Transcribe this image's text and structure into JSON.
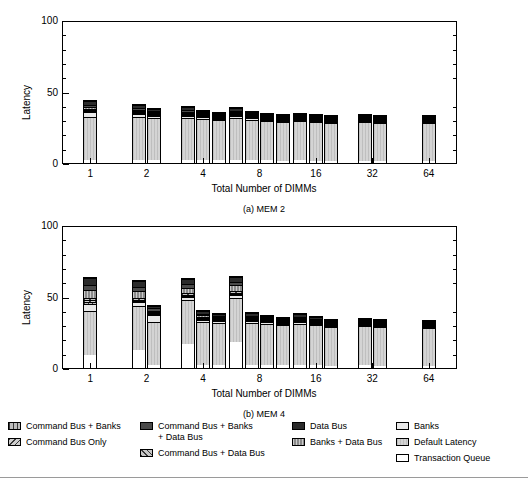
{
  "figure": {
    "panels": [
      {
        "id": "mem2",
        "caption": "(a) MEM 2",
        "xlabel": "Total Number of DIMMs",
        "ylabel": "Latency"
      },
      {
        "id": "mem4",
        "caption": "(b) MEM 4",
        "xlabel": "Total Number of DIMMs",
        "ylabel": "Latency"
      }
    ],
    "yticks": [
      "0",
      "50",
      "100"
    ],
    "xticks": [
      "1",
      "2",
      "4",
      "8",
      "16",
      "32",
      "64"
    ],
    "legend": {
      "col1": [
        {
          "key": "command-bus-banks",
          "label": "Command Bus + Banks",
          "fill": "f-cbb"
        },
        {
          "key": "command-bus-only",
          "label": "Command Bus Only",
          "fill": "f-cbo"
        }
      ],
      "col2": [
        {
          "key": "command-bus-banks-data-bus",
          "label": "Command Bus + Banks\n+ Data Bus",
          "fill": "f-cbbdb"
        },
        {
          "key": "command-bus-data-bus",
          "label": "Command Bus + Data Bus",
          "fill": "f-cbdb"
        }
      ],
      "col3": [
        {
          "key": "data-bus",
          "label": "Data Bus",
          "fill": "f-db"
        },
        {
          "key": "banks-data-bus",
          "label": "Banks + Data Bus",
          "fill": "f-bdb"
        }
      ],
      "col4": [
        {
          "key": "banks",
          "label": "Banks",
          "fill": "f-banks"
        },
        {
          "key": "default-latency",
          "label": "Default Latency",
          "fill": "f-def"
        },
        {
          "key": "transaction-queue",
          "label": "Transaction Queue",
          "fill": "f-tq"
        }
      ]
    }
  },
  "chart_data": [
    {
      "type": "bar",
      "subtype": "stacked-grouped",
      "title": "(a) MEM 2",
      "xlabel": "Total Number of DIMMs",
      "ylabel": "Latency",
      "ylim": [
        0,
        100
      ],
      "yticks": [
        0,
        50,
        100
      ],
      "grid": false,
      "legend_position": "below-figure",
      "categories": [
        "1",
        "2",
        "4",
        "8",
        "16",
        "32",
        "64"
      ],
      "bars_per_category": [
        1,
        2,
        3,
        4,
        3,
        2,
        1
      ],
      "stack_order": [
        "Transaction Queue",
        "Default Latency",
        "Banks",
        "Command Bus + Banks",
        "Command Bus Only",
        "Command Bus + Data Bus",
        "Banks + Data Bus",
        "Command Bus + Banks + Data Bus",
        "Data Bus"
      ],
      "groups": [
        {
          "category": "1",
          "bars": [
            {
              "total": 45.0,
              "segments": {
                "Transaction Queue": 2.0,
                "Default Latency": 31.5,
                "Banks": 3.5,
                "Command Bus + Banks": 0.8,
                "Command Bus Only": 0.7,
                "Command Bus + Data Bus": 0.8,
                "Banks + Data Bus": 1.2,
                "Command Bus + Banks + Data Bus": 1.5,
                "Data Bus": 3.0
              }
            }
          ]
        },
        {
          "category": "2",
          "bars": [
            {
              "total": 42.0,
              "segments": {
                "Transaction Queue": 2.0,
                "Default Latency": 31.5,
                "Banks": 2.0,
                "Command Bus + Banks": 0.7,
                "Command Bus Only": 0.6,
                "Command Bus + Data Bus": 0.7,
                "Banks + Data Bus": 1.0,
                "Command Bus + Banks + Data Bus": 1.2,
                "Data Bus": 2.3
              }
            },
            {
              "total": 39.5,
              "segments": {
                "Transaction Queue": 2.0,
                "Default Latency": 31.5,
                "Banks": 1.2,
                "Command Bus + Banks": 0.5,
                "Command Bus Only": 0.4,
                "Command Bus + Data Bus": 0.5,
                "Banks + Data Bus": 0.8,
                "Command Bus + Banks + Data Bus": 1.0,
                "Data Bus": 1.6
              }
            }
          ]
        },
        {
          "category": "4",
          "bars": [
            {
              "total": 40.5,
              "segments": {
                "Transaction Queue": 2.0,
                "Default Latency": 31.5,
                "Banks": 1.5,
                "Command Bus + Banks": 0.5,
                "Command Bus Only": 0.4,
                "Command Bus + Data Bus": 0.5,
                "Banks + Data Bus": 0.8,
                "Command Bus + Banks + Data Bus": 1.1,
                "Data Bus": 2.2
              }
            },
            {
              "total": 37.8,
              "segments": {
                "Transaction Queue": 2.0,
                "Default Latency": 31.5,
                "Banks": 1.0,
                "Command Bus + Banks": 0.3,
                "Command Bus Only": 0.3,
                "Command Bus + Data Bus": 0.3,
                "Banks + Data Bus": 0.6,
                "Command Bus + Banks + Data Bus": 0.8,
                "Data Bus": 1.0
              }
            },
            {
              "total": 36.5,
              "segments": {
                "Transaction Queue": 2.0,
                "Default Latency": 31.5,
                "Banks": 0.8,
                "Command Bus + Banks": 0.2,
                "Command Bus Only": 0.2,
                "Command Bus + Data Bus": 0.2,
                "Banks + Data Bus": 0.4,
                "Command Bus + Banks + Data Bus": 0.5,
                "Data Bus": 0.7
              }
            }
          ]
        },
        {
          "category": "8",
          "bars": [
            {
              "total": 40.0,
              "segments": {
                "Transaction Queue": 2.0,
                "Default Latency": 31.5,
                "Banks": 1.3,
                "Command Bus + Banks": 0.4,
                "Command Bus Only": 0.3,
                "Command Bus + Data Bus": 0.4,
                "Banks + Data Bus": 0.7,
                "Command Bus + Banks + Data Bus": 1.0,
                "Data Bus": 2.4
              }
            },
            {
              "total": 37.2,
              "segments": {
                "Transaction Queue": 2.0,
                "Default Latency": 31.5,
                "Banks": 0.9,
                "Command Bus + Banks": 0.2,
                "Command Bus Only": 0.2,
                "Command Bus + Data Bus": 0.2,
                "Banks + Data Bus": 0.5,
                "Command Bus + Banks + Data Bus": 0.6,
                "Data Bus": 1.1
              }
            },
            {
              "total": 35.8,
              "segments": {
                "Transaction Queue": 2.0,
                "Default Latency": 31.5,
                "Banks": 0.7,
                "Command Bus + Banks": 0.2,
                "Command Bus Only": 0.2,
                "Command Bus + Data Bus": 0.2,
                "Banks + Data Bus": 0.3,
                "Command Bus + Banks + Data Bus": 0.4,
                "Data Bus": 0.3
              }
            },
            {
              "total": 35.0,
              "segments": {
                "Transaction Queue": 2.0,
                "Default Latency": 31.5,
                "Banks": 0.5,
                "Command Bus + Banks": 0.1,
                "Command Bus Only": 0.1,
                "Command Bus + Data Bus": 0.1,
                "Banks + Data Bus": 0.2,
                "Command Bus + Banks + Data Bus": 0.2,
                "Data Bus": 0.3
              }
            }
          ]
        },
        {
          "category": "16",
          "bars": [
            {
              "total": 36.0,
              "segments": {
                "Transaction Queue": 2.0,
                "Default Latency": 31.5,
                "Banks": 0.6,
                "Command Bus + Banks": 0.1,
                "Command Bus Only": 0.1,
                "Command Bus + Data Bus": 0.1,
                "Banks + Data Bus": 0.2,
                "Command Bus + Banks + Data Bus": 0.4,
                "Data Bus": 1.0
              }
            },
            {
              "total": 34.8,
              "segments": {
                "Transaction Queue": 2.0,
                "Default Latency": 31.5,
                "Banks": 0.5,
                "Command Bus + Banks": 0.1,
                "Command Bus Only": 0.1,
                "Command Bus + Data Bus": 0.1,
                "Banks + Data Bus": 0.1,
                "Command Bus + Banks + Data Bus": 0.2,
                "Data Bus": 0.2
              }
            },
            {
              "total": 34.2,
              "segments": {
                "Transaction Queue": 2.0,
                "Default Latency": 31.5,
                "Banks": 0.3,
                "Command Bus + Banks": 0.05,
                "Command Bus Only": 0.05,
                "Command Bus + Data Bus": 0.05,
                "Banks + Data Bus": 0.05,
                "Command Bus + Banks + Data Bus": 0.1,
                "Data Bus": 0.1
              }
            }
          ]
        },
        {
          "category": "32",
          "bars": [
            {
              "total": 34.8,
              "segments": {
                "Transaction Queue": 2.0,
                "Default Latency": 31.5,
                "Banks": 0.4,
                "Command Bus + Banks": 0.05,
                "Command Bus Only": 0.05,
                "Command Bus + Data Bus": 0.05,
                "Banks + Data Bus": 0.05,
                "Command Bus + Banks + Data Bus": 0.2,
                "Data Bus": 0.5
              }
            },
            {
              "total": 34.2,
              "segments": {
                "Transaction Queue": 2.0,
                "Default Latency": 31.5,
                "Banks": 0.3,
                "Command Bus + Banks": 0.05,
                "Command Bus Only": 0.05,
                "Command Bus + Data Bus": 0.05,
                "Banks + Data Bus": 0.05,
                "Command Bus + Banks + Data Bus": 0.1,
                "Data Bus": 0.1
              }
            }
          ]
        },
        {
          "category": "64",
          "bars": [
            {
              "total": 34.2,
              "segments": {
                "Transaction Queue": 2.0,
                "Default Latency": 31.5,
                "Banks": 0.3,
                "Command Bus + Banks": 0.05,
                "Command Bus Only": 0.05,
                "Command Bus + Data Bus": 0.05,
                "Banks + Data Bus": 0.05,
                "Command Bus + Banks + Data Bus": 0.1,
                "Data Bus": 0.1
              }
            }
          ]
        }
      ]
    },
    {
      "type": "bar",
      "subtype": "stacked-grouped",
      "title": "(b) MEM 4",
      "xlabel": "Total Number of DIMMs",
      "ylabel": "Latency",
      "ylim": [
        0,
        100
      ],
      "yticks": [
        0,
        50,
        100
      ],
      "grid": false,
      "legend_position": "below-figure",
      "categories": [
        "1",
        "2",
        "4",
        "8",
        "16",
        "32",
        "64"
      ],
      "bars_per_category": [
        1,
        2,
        3,
        4,
        3,
        2,
        1
      ],
      "stack_order": [
        "Transaction Queue",
        "Default Latency",
        "Banks",
        "Command Bus + Banks",
        "Command Bus Only",
        "Command Bus + Data Bus",
        "Banks + Data Bus",
        "Command Bus + Banks + Data Bus",
        "Data Bus"
      ],
      "groups": [
        {
          "category": "1",
          "bars": [
            {
              "total": 64.0,
              "segments": {
                "Transaction Queue": 9.5,
                "Default Latency": 31.5,
                "Banks": 4.5,
                "Command Bus + Banks": 1.5,
                "Command Bus Only": 1.5,
                "Command Bus + Data Bus": 1.5,
                "Banks + Data Bus": 6.0,
                "Command Bus + Banks + Data Bus": 3.0,
                "Data Bus": 5.0
              }
            }
          ]
        },
        {
          "category": "2",
          "bars": [
            {
              "total": 62.0,
              "segments": {
                "Transaction Queue": 13.0,
                "Default Latency": 31.5,
                "Banks": 2.5,
                "Command Bus + Banks": 1.0,
                "Command Bus Only": 1.0,
                "Command Bus + Data Bus": 1.0,
                "Banks + Data Bus": 5.0,
                "Command Bus + Banks + Data Bus": 3.0,
                "Data Bus": 4.0
              }
            },
            {
              "total": 45.0,
              "segments": {
                "Transaction Queue": 2.0,
                "Default Latency": 31.5,
                "Banks": 4.5,
                "Command Bus + Banks": 0.8,
                "Command Bus Only": 0.7,
                "Command Bus + Data Bus": 0.8,
                "Banks + Data Bus": 1.2,
                "Command Bus + Banks + Data Bus": 1.5,
                "Data Bus": 2.0
              }
            }
          ]
        },
        {
          "category": "4",
          "bars": [
            {
              "total": 63.5,
              "segments": {
                "Transaction Queue": 17.0,
                "Default Latency": 31.5,
                "Banks": 2.0,
                "Command Bus + Banks": 1.0,
                "Command Bus Only": 1.0,
                "Command Bus + Data Bus": 1.0,
                "Banks + Data Bus": 4.0,
                "Command Bus + Banks + Data Bus": 2.5,
                "Data Bus": 3.5
              }
            },
            {
              "total": 41.5,
              "segments": {
                "Transaction Queue": 2.0,
                "Default Latency": 31.5,
                "Banks": 1.5,
                "Command Bus + Banks": 0.6,
                "Command Bus Only": 0.6,
                "Command Bus + Data Bus": 0.6,
                "Banks + Data Bus": 1.2,
                "Command Bus + Banks + Data Bus": 1.3,
                "Data Bus": 2.2
              }
            },
            {
              "total": 39.5,
              "segments": {
                "Transaction Queue": 2.0,
                "Default Latency": 31.5,
                "Banks": 1.2,
                "Command Bus + Banks": 0.4,
                "Command Bus Only": 0.4,
                "Command Bus + Data Bus": 0.4,
                "Banks + Data Bus": 0.8,
                "Command Bus + Banks + Data Bus": 1.0,
                "Data Bus": 1.8
              }
            }
          ]
        },
        {
          "category": "8",
          "bars": [
            {
              "total": 65.0,
              "segments": {
                "Transaction Queue": 18.5,
                "Default Latency": 31.5,
                "Banks": 2.0,
                "Command Bus + Banks": 1.0,
                "Command Bus Only": 1.0,
                "Command Bus + Data Bus": 1.0,
                "Banks + Data Bus": 4.0,
                "Command Bus + Banks + Data Bus": 2.5,
                "Data Bus": 3.5
              }
            },
            {
              "total": 40.0,
              "segments": {
                "Transaction Queue": 2.0,
                "Default Latency": 31.5,
                "Banks": 1.3,
                "Command Bus + Banks": 0.4,
                "Command Bus Only": 0.4,
                "Command Bus + Data Bus": 0.4,
                "Banks + Data Bus": 0.9,
                "Command Bus + Banks + Data Bus": 1.0,
                "Data Bus": 2.1
              }
            },
            {
              "total": 38.0,
              "segments": {
                "Transaction Queue": 2.0,
                "Default Latency": 31.5,
                "Banks": 1.0,
                "Command Bus + Banks": 0.3,
                "Command Bus Only": 0.3,
                "Command Bus + Data Bus": 0.3,
                "Banks + Data Bus": 0.7,
                "Command Bus + Banks + Data Bus": 0.8,
                "Data Bus": 1.1
              }
            },
            {
              "total": 36.5,
              "segments": {
                "Transaction Queue": 2.0,
                "Default Latency": 31.5,
                "Banks": 0.8,
                "Command Bus + Banks": 0.2,
                "Command Bus Only": 0.2,
                "Command Bus + Data Bus": 0.2,
                "Banks + Data Bus": 0.4,
                "Command Bus + Banks + Data Bus": 0.5,
                "Data Bus": 0.7
              }
            }
          ]
        },
        {
          "category": "16",
          "bars": [
            {
              "total": 39.0,
              "segments": {
                "Transaction Queue": 2.0,
                "Default Latency": 31.5,
                "Banks": 1.0,
                "Command Bus + Banks": 0.3,
                "Command Bus Only": 0.3,
                "Command Bus + Data Bus": 0.3,
                "Banks + Data Bus": 0.8,
                "Command Bus + Banks + Data Bus": 0.9,
                "Data Bus": 1.9
              }
            },
            {
              "total": 37.0,
              "segments": {
                "Transaction Queue": 2.0,
                "Default Latency": 31.5,
                "Banks": 0.8,
                "Command Bus + Banks": 0.2,
                "Command Bus Only": 0.2,
                "Command Bus + Data Bus": 0.2,
                "Banks + Data Bus": 0.4,
                "Command Bus + Banks + Data Bus": 0.6,
                "Data Bus": 1.1
              }
            },
            {
              "total": 35.2,
              "segments": {
                "Transaction Queue": 2.0,
                "Default Latency": 31.5,
                "Banks": 0.5,
                "Command Bus + Banks": 0.1,
                "Command Bus Only": 0.1,
                "Command Bus + Data Bus": 0.1,
                "Banks + Data Bus": 0.2,
                "Command Bus + Banks + Data Bus": 0.3,
                "Data Bus": 0.4
              }
            }
          ]
        },
        {
          "category": "32",
          "bars": [
            {
              "total": 36.0,
              "segments": {
                "Transaction Queue": 2.0,
                "Default Latency": 31.5,
                "Banks": 0.6,
                "Command Bus + Banks": 0.1,
                "Command Bus Only": 0.1,
                "Command Bus + Data Bus": 0.1,
                "Banks + Data Bus": 0.3,
                "Command Bus + Banks + Data Bus": 0.4,
                "Data Bus": 0.9
              }
            },
            {
              "total": 34.8,
              "segments": {
                "Transaction Queue": 2.0,
                "Default Latency": 31.5,
                "Banks": 0.4,
                "Command Bus + Banks": 0.05,
                "Command Bus Only": 0.05,
                "Command Bus + Data Bus": 0.05,
                "Banks + Data Bus": 0.15,
                "Command Bus + Banks + Data Bus": 0.2,
                "Data Bus": 0.4
              }
            }
          ]
        },
        {
          "category": "64",
          "bars": [
            {
              "total": 34.5,
              "segments": {
                "Transaction Queue": 2.0,
                "Default Latency": 31.5,
                "Banks": 0.4,
                "Command Bus + Banks": 0.05,
                "Command Bus Only": 0.05,
                "Command Bus + Data Bus": 0.05,
                "Banks + Data Bus": 0.1,
                "Command Bus + Banks + Data Bus": 0.15,
                "Data Bus": 0.2
              }
            }
          ]
        }
      ]
    }
  ]
}
